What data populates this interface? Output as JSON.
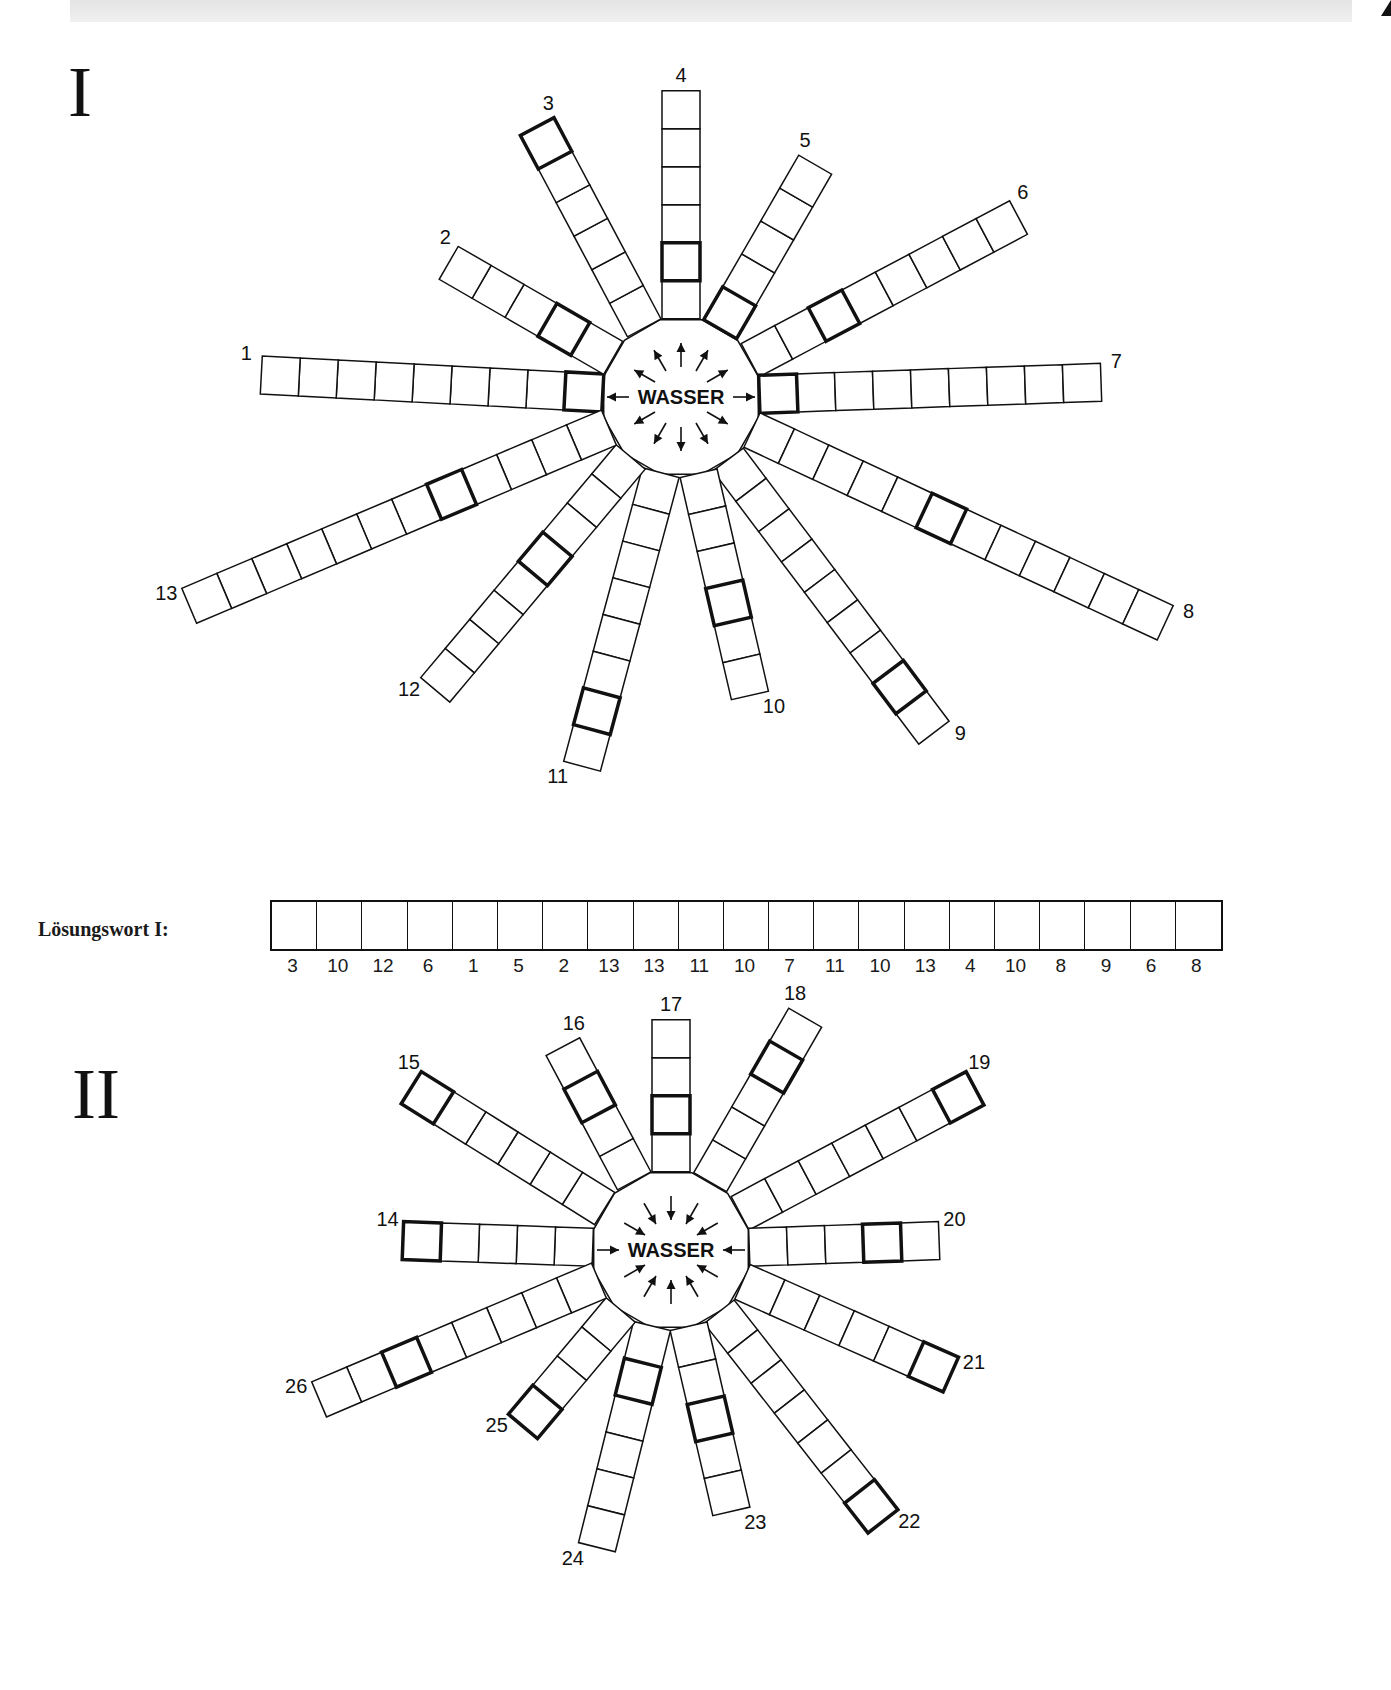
{
  "header": {
    "text": ""
  },
  "sections": [
    {
      "numeral": "I",
      "center_word": "WASSER",
      "arrow_direction": "outward",
      "center": [
        681,
        397
      ],
      "hub_radius": 80,
      "cell_size": 38,
      "arms": [
        {
          "number": "1",
          "angle": 177,
          "cells": 9,
          "bold": 1
        },
        {
          "number": "2",
          "angle": 150,
          "cells": 5,
          "bold": 2
        },
        {
          "number": "3",
          "angle": 118,
          "cells": 6,
          "bold": 6
        },
        {
          "number": "4",
          "angle": 90,
          "cells": 6,
          "bold": 2
        },
        {
          "number": "5",
          "angle": 60,
          "cells": 5,
          "bold": 1
        },
        {
          "number": "6",
          "angle": 28,
          "cells": 8,
          "bold": 3
        },
        {
          "number": "7",
          "angle": 2,
          "cells": 9,
          "bold": 1
        },
        {
          "number": "8",
          "angle": -25,
          "cells": 12,
          "bold": 6
        },
        {
          "number": "9",
          "angle": -53,
          "cells": 9,
          "bold": 8
        },
        {
          "number": "10",
          "angle": -77,
          "cells": 6,
          "bold": 4
        },
        {
          "number": "11",
          "angle": -105,
          "cells": 8,
          "bold": 7
        },
        {
          "number": "12",
          "angle": -130,
          "cells": 8,
          "bold": 4
        },
        {
          "number": "13",
          "angle": -157,
          "cells": 12,
          "bold": 5
        }
      ]
    },
    {
      "numeral": "II",
      "center_word": "WASSER",
      "arrow_direction": "inward",
      "center": [
        671,
        1250
      ],
      "hub_radius": 80,
      "cell_size": 38,
      "arms": [
        {
          "number": "14",
          "angle": 178,
          "cells": 5,
          "bold": 5
        },
        {
          "number": "15",
          "angle": 148,
          "cells": 6,
          "bold": 6
        },
        {
          "number": "16",
          "angle": 118,
          "cells": 4,
          "bold": 3
        },
        {
          "number": "17",
          "angle": 90,
          "cells": 4,
          "bold": 2
        },
        {
          "number": "18",
          "angle": 60,
          "cells": 5,
          "bold": 4
        },
        {
          "number": "19",
          "angle": 28,
          "cells": 7,
          "bold": 7
        },
        {
          "number": "20",
          "angle": 2,
          "cells": 5,
          "bold": 4
        },
        {
          "number": "21",
          "angle": -24,
          "cells": 6,
          "bold": 6
        },
        {
          "number": "22",
          "angle": -52,
          "cells": 7,
          "bold": 7
        },
        {
          "number": "23",
          "angle": -77,
          "cells": 5,
          "bold": 3
        },
        {
          "number": "24",
          "angle": -104,
          "cells": 6,
          "bold": 2
        },
        {
          "number": "25",
          "angle": -130,
          "cells": 4,
          "bold": 4
        },
        {
          "number": "26",
          "angle": -157,
          "cells": 8,
          "bold": 6
        }
      ]
    }
  ],
  "solution": {
    "label": "Lösungswort I:",
    "cell_count": 21,
    "numbers": [
      "3",
      "10",
      "12",
      "6",
      "1",
      "5",
      "2",
      "13",
      "13",
      "11",
      "10",
      "7",
      "11",
      "10",
      "13",
      "4",
      "10",
      "8",
      "9",
      "6",
      "8"
    ]
  },
  "colors": {
    "line": "#111111",
    "background": "#ffffff"
  }
}
